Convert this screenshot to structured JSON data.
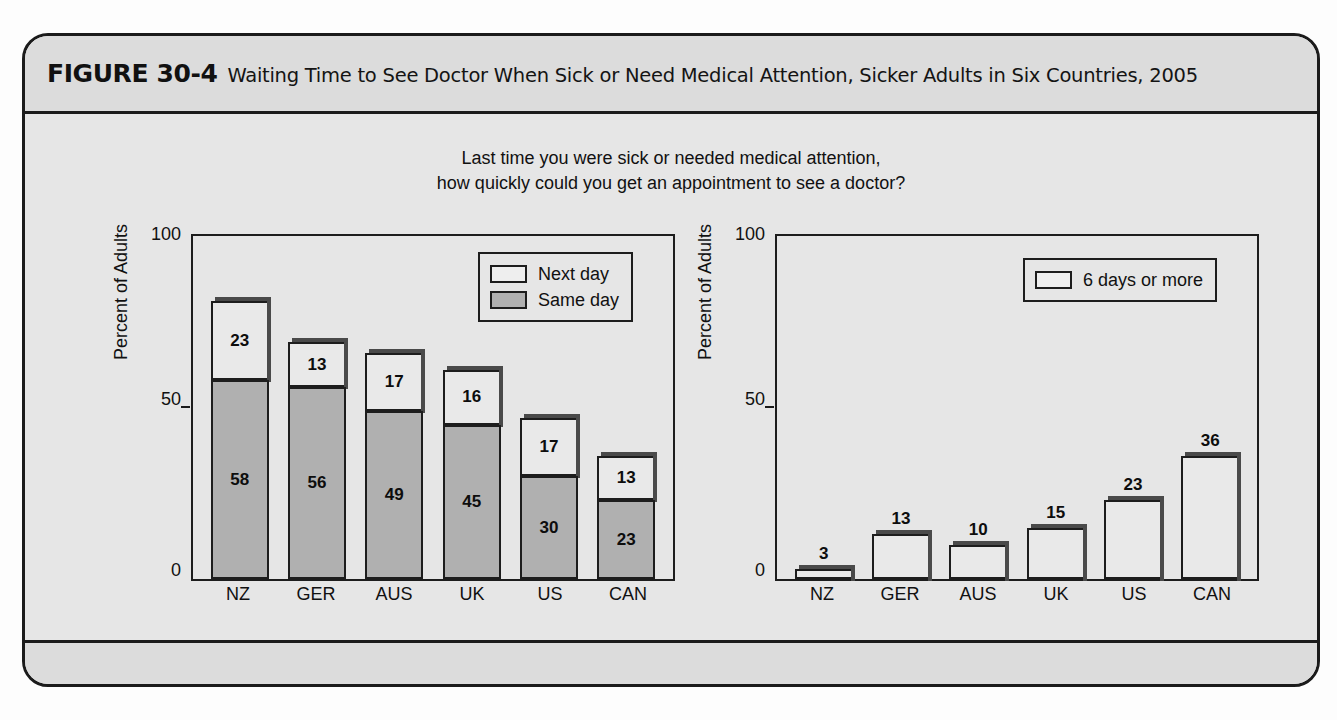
{
  "figure": {
    "label": "FIGURE 30-4",
    "title": "Waiting Time to See Doctor When Sick or Need Medical Attention, Sicker Adults in Six Countries, 2005",
    "footnote": "NZ = New Zealand; GER = Germany; AUS = Australia; UK = United Kingdom; US = United States; CAN = Canada."
  },
  "subtitle": {
    "line1": "Last time you were sick or needed medical attention,",
    "line2": "how quickly could you get an appointment to see a doctor?"
  },
  "chart_data": [
    {
      "type": "bar",
      "id": "left",
      "stacked": true,
      "title": "",
      "xlabel": "",
      "ylabel": "Percent of Adults",
      "ylim": [
        0,
        100
      ],
      "yticks": [
        "0",
        "50",
        "100"
      ],
      "grid": false,
      "legend_position": "top-right",
      "categories": [
        "NZ",
        "GER",
        "AUS",
        "UK",
        "US",
        "CAN"
      ],
      "series": [
        {
          "name": "Same day",
          "color": "#b0b0b0",
          "values": [
            58,
            56,
            49,
            45,
            30,
            23
          ]
        },
        {
          "name": "Next day",
          "color": "#e9e9e9",
          "values": [
            23,
            13,
            17,
            16,
            17,
            13
          ]
        }
      ]
    },
    {
      "type": "bar",
      "id": "right",
      "stacked": false,
      "title": "",
      "xlabel": "",
      "ylabel": "Percent of Adults",
      "ylim": [
        0,
        100
      ],
      "yticks": [
        "0",
        "50",
        "100"
      ],
      "grid": false,
      "legend_position": "top-right",
      "categories": [
        "NZ",
        "GER",
        "AUS",
        "UK",
        "US",
        "CAN"
      ],
      "series": [
        {
          "name": "6 days or more",
          "color": "#e9e9e9",
          "values": [
            3,
            13,
            10,
            15,
            23,
            36
          ]
        }
      ]
    }
  ]
}
